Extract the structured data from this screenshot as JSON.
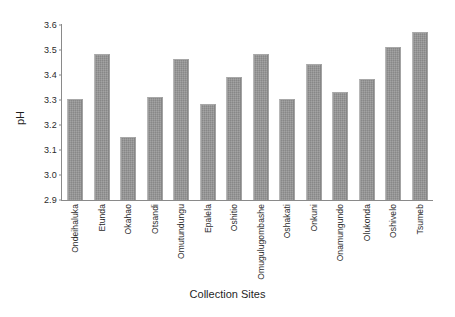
{
  "chart_data": {
    "type": "bar",
    "title": "",
    "xlabel": "Collection Sites",
    "ylabel": "pH",
    "ylim": [
      2.9,
      3.6
    ],
    "ytick_step": 0.1,
    "yticks": [
      "3.6",
      "3.5",
      "3.4",
      "3.3",
      "3.2",
      "3.1",
      "3.0",
      "2.9"
    ],
    "grid": false,
    "legend": null,
    "bar_color": "#919191",
    "axis_color": "#8a8a8a",
    "categories": [
      "Ondeihaluka",
      "Etunda",
      "Okahao",
      "Otsandi",
      "Omutundungu",
      "Epalela",
      "Oshitio",
      "Omugulugombashe",
      "Oshakati",
      "Onkuni",
      "Onamungundo",
      "Olukonda",
      "Oshivelo",
      "Tsumeb"
    ],
    "values": [
      3.3,
      3.48,
      3.15,
      3.31,
      3.46,
      3.28,
      3.39,
      3.48,
      3.3,
      3.44,
      3.33,
      3.38,
      3.51,
      3.57
    ]
  }
}
